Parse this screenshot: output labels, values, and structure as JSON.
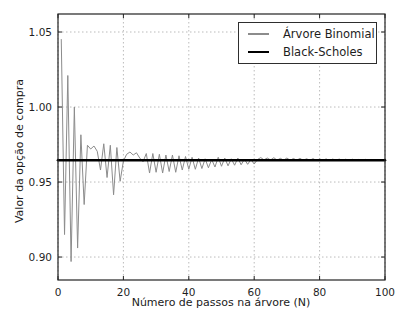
{
  "figure": {
    "width": 412,
    "height": 327,
    "background": "#ffffff"
  },
  "chart_data": {
    "type": "line",
    "title": "",
    "xlabel": "Número de passos na árvore (N)",
    "ylabel": "Valor da opção de compra",
    "xlim": [
      0,
      100
    ],
    "ylim": [
      0.8847,
      1.062
    ],
    "x_ticks": [
      "0",
      "20",
      "40",
      "60",
      "80",
      "100"
    ],
    "x_tick_values": [
      0,
      20,
      40,
      60,
      80,
      100
    ],
    "y_ticks": [
      "0.90",
      "0.95",
      "1.00",
      "1.05"
    ],
    "y_tick_values": [
      0.9,
      0.95,
      1.0,
      1.05
    ],
    "grid": {
      "show": true,
      "style": "dotted",
      "color": "#bbbbbb"
    },
    "axes_color": "#222222",
    "tick_label_color": "#1f1f1f",
    "legend_position": "upper right",
    "series": [
      {
        "name": "Árvore Binomial",
        "color": "#8c8c8c",
        "line_width": 1,
        "x": [
          1,
          2,
          3,
          4,
          5,
          6,
          7,
          8,
          9,
          10,
          11,
          12,
          13,
          14,
          15,
          16,
          17,
          18,
          19,
          20,
          21,
          22,
          23,
          24,
          25,
          26,
          27,
          28,
          29,
          30,
          31,
          32,
          33,
          34,
          35,
          36,
          37,
          38,
          39,
          40,
          41,
          42,
          43,
          44,
          45,
          46,
          47,
          48,
          49,
          50,
          51,
          52,
          53,
          54,
          55,
          56,
          57,
          58,
          59,
          60,
          61,
          62,
          63,
          64,
          65,
          66,
          67,
          68,
          69,
          70,
          71,
          72,
          73,
          74,
          75,
          76,
          77,
          78,
          79,
          80,
          81,
          82,
          83,
          84,
          85,
          86,
          87,
          88,
          89,
          90,
          91,
          92,
          93,
          94,
          95,
          96,
          97,
          98,
          99,
          100
        ],
        "y": [
          1.045,
          0.915,
          1.021,
          0.897,
          1.0,
          0.906,
          0.9815,
          0.935,
          0.9745,
          0.972,
          0.974,
          0.9705,
          0.958,
          0.9755,
          0.953,
          0.9745,
          0.9415,
          0.973,
          0.9505,
          0.964,
          0.9685,
          0.97,
          0.968,
          0.9695,
          0.966,
          0.9635,
          0.969,
          0.956,
          0.969,
          0.9565,
          0.9685,
          0.956,
          0.968,
          0.957,
          0.968,
          0.9565,
          0.9675,
          0.958,
          0.967,
          0.9585,
          0.9665,
          0.9585,
          0.966,
          0.959,
          0.9655,
          0.9595,
          0.965,
          0.96,
          0.9665,
          0.9605,
          0.966,
          0.9608,
          0.9655,
          0.9612,
          0.966,
          0.9615,
          0.9652,
          0.9618,
          0.965,
          0.962,
          0.965,
          0.9663,
          0.9648,
          0.966,
          0.9647,
          0.9662,
          0.9646,
          0.9658,
          0.9646,
          0.966,
          0.9645,
          0.9657,
          0.9645,
          0.9658,
          0.9644,
          0.9655,
          0.9645,
          0.9656,
          0.9644,
          0.9654,
          0.9645,
          0.9654,
          0.9644,
          0.9653,
          0.9645,
          0.9653,
          0.9644,
          0.9652,
          0.9645,
          0.9652,
          0.9644,
          0.9651,
          0.9645,
          0.9651,
          0.9644,
          0.965,
          0.9645,
          0.965,
          0.9645,
          0.9649
        ]
      },
      {
        "name": "Black-Scholes",
        "color": "#000000",
        "line_width": 2.6,
        "x": [
          0,
          100
        ],
        "y": [
          0.9645,
          0.9645
        ]
      }
    ]
  }
}
